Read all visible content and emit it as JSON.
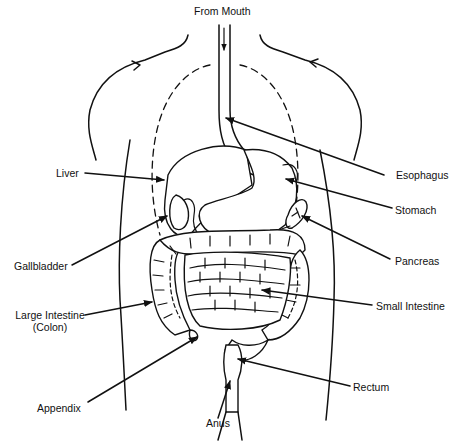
{
  "diagram": {
    "colors": {
      "ink": "#111111",
      "background": "#ffffff"
    },
    "labels": {
      "from_mouth": "From Mouth",
      "liver": "Liver",
      "gallbladder": "Gallbladder",
      "large_intestine_line1": "Large Intestine",
      "large_intestine_line2": "(Colon)",
      "appendix": "Appendix",
      "anus": "Anus",
      "esophagus": "Esophagus",
      "stomach": "Stomach",
      "pancreas": "Pancreas",
      "small_intestine": "Small Intestine",
      "rectum": "Rectum"
    }
  }
}
